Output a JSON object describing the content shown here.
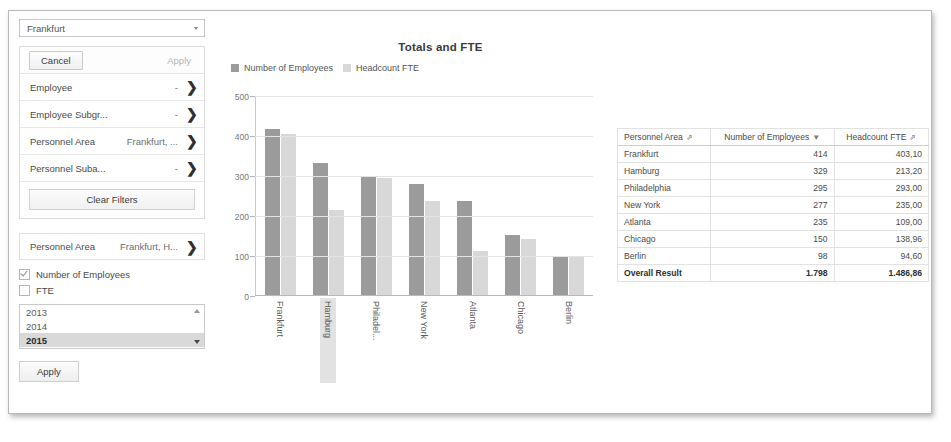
{
  "sidebar": {
    "dropdown": {
      "value": "Frankfurt",
      "icon": "chevron-down-icon"
    },
    "buttons": {
      "cancel": "Cancel",
      "apply": "Apply",
      "clear": "Clear Filters",
      "apply_bottom": "Apply"
    },
    "filters": [
      {
        "name": "Employee",
        "value": "-"
      },
      {
        "name": "Employee Subgr...",
        "value": "-"
      },
      {
        "name": "Personnel Area",
        "value": "Frankfurt, ..."
      },
      {
        "name": "Personnel Suba...",
        "value": "-"
      }
    ],
    "personnel_area": {
      "name": "Personnel Area",
      "value": "Frankfurt, H..."
    },
    "measures": [
      {
        "label": "Number of Employees",
        "checked": true
      },
      {
        "label": "FTE",
        "checked": false
      }
    ],
    "years": [
      {
        "label": "2013",
        "selected": false
      },
      {
        "label": "2014",
        "selected": false
      },
      {
        "label": "2015",
        "selected": true
      }
    ]
  },
  "chart_data": {
    "type": "bar",
    "title": "Totals and FTE",
    "xlabel": "",
    "ylabel": "",
    "ylim": [
      0,
      500
    ],
    "yticks": [
      0,
      100,
      200,
      300,
      400,
      500
    ],
    "grid": true,
    "legend_position": "top-left",
    "highlighted_category": "Hamburg",
    "categories": [
      "Frankfurt",
      "Hamburg",
      "Philadel...",
      "New York",
      "Atlanta",
      "Chicago",
      "Berlin"
    ],
    "series": [
      {
        "name": "Number of Employees",
        "color": "#9b9b9b",
        "values": [
          414,
          329,
          295,
          277,
          235,
          150,
          98
        ]
      },
      {
        "name": "Headcount FTE",
        "color": "#d8d8d8",
        "values": [
          403.1,
          213.2,
          293.0,
          235.0,
          109.0,
          138.96,
          94.6
        ]
      }
    ]
  },
  "table": {
    "columns": [
      {
        "label": "Personnel Area",
        "icon": "sort-icon"
      },
      {
        "label": "Number of Employees",
        "icon": "filter-down-icon"
      },
      {
        "label": "Headcount FTE",
        "icon": "sort-icon"
      }
    ],
    "rows": [
      {
        "area": "Frankfurt",
        "employees": "414",
        "fte": "403,10"
      },
      {
        "area": "Hamburg",
        "employees": "329",
        "fte": "213,20"
      },
      {
        "area": "Philadelphia",
        "employees": "295",
        "fte": "293,00"
      },
      {
        "area": "New York",
        "employees": "277",
        "fte": "235,00"
      },
      {
        "area": "Atlanta",
        "employees": "235",
        "fte": "109,00"
      },
      {
        "area": "Chicago",
        "employees": "150",
        "fte": "138,96"
      },
      {
        "area": "Berlin",
        "employees": "98",
        "fte": "94,60"
      }
    ],
    "total": {
      "area": "Overall Result",
      "employees": "1.798",
      "fte": "1.486,86"
    }
  }
}
